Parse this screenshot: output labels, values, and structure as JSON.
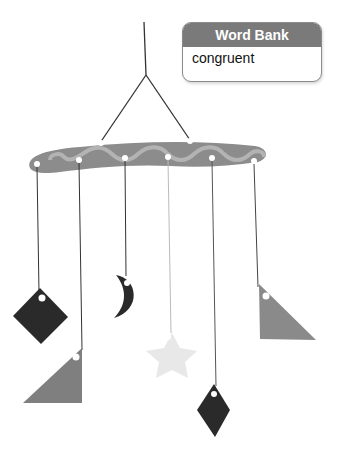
{
  "word_bank": {
    "title": "Word Bank",
    "words": [
      "congruent"
    ]
  },
  "illustration": {
    "subject": "hanging mobile",
    "shapes": [
      {
        "name": "square",
        "color": "#2a2a2a"
      },
      {
        "name": "right-triangle-left",
        "color": "#7f7f7f"
      },
      {
        "name": "crescent-moon",
        "color": "#2a2a2a"
      },
      {
        "name": "star",
        "color": "#e6e6e6"
      },
      {
        "name": "rhombus",
        "color": "#2a2a2a"
      },
      {
        "name": "right-triangle-right",
        "color": "#8a8a8a"
      }
    ],
    "bar_color": "#8c8c8c",
    "wave_color": "#b3b3b3"
  }
}
